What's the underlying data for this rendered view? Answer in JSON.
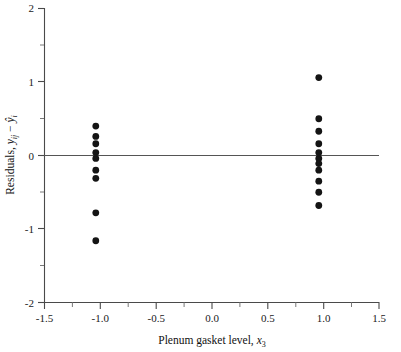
{
  "chart_data": {
    "type": "scatter",
    "title": "",
    "xlabel": "Plenum gasket level, x3",
    "ylabel": "Residuals, yij - yhat_i",
    "xlim": [
      -1.5,
      1.5
    ],
    "ylim": [
      -2,
      2
    ],
    "grid": false,
    "legend": null,
    "x_ticks": [
      -1.5,
      -1.0,
      -0.5,
      0.0,
      0.5,
      1.0,
      1.5
    ],
    "x_tick_labels": [
      "-1.5",
      "-1.0",
      "-0.5",
      "0.0",
      "0.5",
      "1.0",
      "1.5"
    ],
    "y_ticks": [
      -2,
      -1,
      0,
      1,
      2
    ],
    "y_tick_labels": [
      "-2",
      "-1",
      "0",
      "1",
      "2"
    ],
    "y_minor_ticks": [
      -1.5,
      -0.5,
      0.5,
      1.5
    ],
    "reference_line": {
      "y": 0,
      "orientation": "horizontal"
    },
    "marker": {
      "shape": "circle",
      "radius": 3.4,
      "color": "#141414"
    },
    "groups": [
      {
        "name": "level -1",
        "x": -1.04,
        "values": [
          0.4,
          0.26,
          0.16,
          0.04,
          -0.04,
          -0.2,
          -0.31,
          -0.78,
          -1.16
        ]
      },
      {
        "name": "level +1",
        "x": 0.96,
        "values": [
          1.06,
          0.5,
          0.33,
          0.16,
          0.04,
          -0.04,
          -0.11,
          -0.2,
          -0.35,
          -0.5,
          -0.68
        ]
      }
    ]
  },
  "labels": {
    "x_axis_prefix": "Plenum gasket level, ",
    "x_axis_var": "x",
    "x_axis_sub": "3",
    "y_axis_prefix": "Residuals, ",
    "y_axis_var1": "y",
    "y_axis_sub1": "ij",
    "y_axis_minus": " − ",
    "y_axis_var2": "ŷ",
    "y_axis_sub2": "i"
  }
}
